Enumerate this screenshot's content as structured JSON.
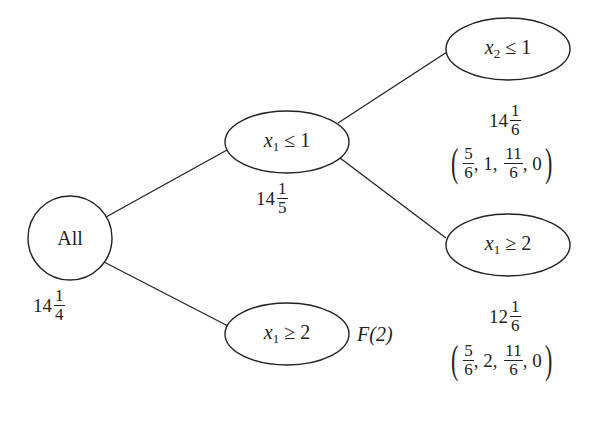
{
  "diagram": {
    "type": "branch-and-bound-tree",
    "nodes": [
      {
        "id": "root",
        "label": "All",
        "value": {
          "whole": "14",
          "num": "1",
          "den": "4"
        }
      },
      {
        "id": "n1",
        "var": "x",
        "sub": "1",
        "op": "≤",
        "rhs": "1",
        "value": {
          "whole": "14",
          "num": "1",
          "den": "5"
        }
      },
      {
        "id": "n2",
        "var": "x",
        "sub": "1",
        "op": "≥",
        "rhs": "2",
        "annotation": "F(2)"
      },
      {
        "id": "n3",
        "var": "x",
        "sub": "2",
        "op": "≤",
        "rhs": "1",
        "value": {
          "whole": "14",
          "num": "1",
          "den": "6"
        },
        "solution": [
          {
            "num": "5",
            "den": "6"
          },
          "1",
          {
            "num": "11",
            "den": "6"
          },
          "0"
        ]
      },
      {
        "id": "n4",
        "var": "x",
        "sub": "1",
        "op": "≥",
        "rhs": "2",
        "value": {
          "whole": "12",
          "num": "1",
          "den": "6"
        },
        "solution": [
          {
            "num": "5",
            "den": "6"
          },
          "2",
          {
            "num": "11",
            "den": "6"
          },
          "0"
        ]
      }
    ],
    "edges": [
      [
        "root",
        "n1"
      ],
      [
        "root",
        "n2"
      ],
      [
        "n1",
        "n3"
      ],
      [
        "n1",
        "n4"
      ]
    ],
    "comma": ","
  }
}
